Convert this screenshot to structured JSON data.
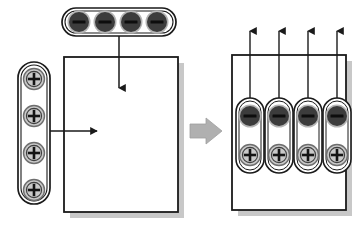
{
  "figure": {
    "type": "process-diagram",
    "title_fragment": "",
    "background_color": "#ffffff",
    "width": 362,
    "height": 230
  },
  "colors": {
    "outline": "#1a1a1a",
    "anion_fill": "#3c3c3c",
    "anion_ring": "#b5b5b5",
    "anion_bar": "#0d0d0d",
    "cation_fill": "#c9c9c9",
    "cation_ring": "#6e6e6e",
    "cation_sign": "#141414",
    "panel_fill": "#ffffff",
    "panel_border": "#1a1a1a",
    "shadow": "#9a9a9a",
    "transition_arrow": "#b0b0b0",
    "capsule_border": "#1a1a1a",
    "capsule_fill": "#ffffff",
    "arrow_line": "#1a1a1a"
  },
  "left_stage": {
    "name": "before-exchange",
    "panel": {
      "label": "membrane-panel",
      "x": 64,
      "y": 57,
      "width": 114,
      "height": 155
    },
    "top_group": {
      "label": "anion-row-capsule",
      "orientation": "horizontal",
      "count": 4,
      "ion_symbol": "−",
      "ion_type": "anion",
      "x": 62,
      "y": 8,
      "width": 114,
      "height": 28
    },
    "left_group": {
      "label": "cation-column-capsule",
      "orientation": "vertical",
      "count": 4,
      "ion_symbol": "+",
      "ion_type": "cation",
      "x": 18,
      "y": 62,
      "width": 32,
      "height": 142
    },
    "arrows": [
      {
        "label": "anion-entry-arrow",
        "direction": "down"
      },
      {
        "label": "cation-entry-arrow",
        "direction": "right"
      }
    ]
  },
  "transition": {
    "label": "transition-arrow",
    "direction": "right",
    "x": 190,
    "y": 118,
    "width": 32,
    "height": 26
  },
  "right_stage": {
    "name": "after-exchange",
    "panel": {
      "label": "membrane-panel",
      "x": 232,
      "y": 55,
      "width": 114,
      "height": 155
    },
    "pairs_count": 4,
    "pair": {
      "label": "ion-pair-capsule",
      "orientation": "vertical",
      "top_ion_symbol": "−",
      "top_ion_type": "anion",
      "bottom_ion_symbol": "+",
      "bottom_ion_type": "cation"
    },
    "exit_arrows": {
      "label": "anion-exit-arrow",
      "direction": "up",
      "count": 4
    }
  },
  "legend": {
    "anion_label": "−",
    "cation_label": "+"
  }
}
